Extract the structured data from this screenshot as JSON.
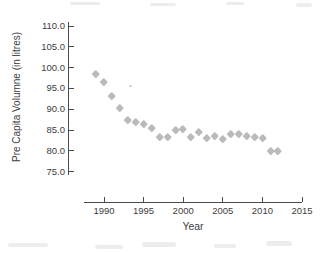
{
  "chart_data": {
    "type": "scatter",
    "title": "",
    "xlabel": "Year",
    "ylabel": "Pre Capita Volumne (in litres)",
    "x_tick_labels": [
      "1990",
      "1995",
      "2000",
      "2005",
      "2010",
      "2015"
    ],
    "x_tick_values": [
      1990,
      1995,
      2000,
      2005,
      2010,
      2015
    ],
    "y_tick_labels": [
      "110.0",
      "105.0",
      "100.0",
      "95.0",
      "90.0",
      "85.0",
      "80.0",
      "75.0"
    ],
    "y_tick_values": [
      110,
      105,
      100,
      95,
      90,
      85,
      80,
      75
    ],
    "xlim": [
      1987.4,
      2015.2
    ],
    "ylim": [
      73.3,
      111.4
    ],
    "grid": false,
    "legend": "none",
    "marker": "diamond",
    "marker_color": "#b3b3b3",
    "axis_color": "#4a4a4a",
    "text_color": "#3d3d3d",
    "x": [
      1989,
      1990,
      1991,
      1992,
      1993,
      1994,
      1995,
      1996,
      1997,
      1998,
      1999,
      2000,
      2001,
      2002,
      2003,
      2004,
      2005,
      2006,
      2007,
      2008,
      2009,
      2010,
      2011,
      2012
    ],
    "y": [
      98.6,
      96.5,
      93.3,
      90.3,
      87.4,
      86.9,
      86.4,
      85.5,
      83.3,
      83.4,
      85.1,
      85.3,
      83.4,
      84.6,
      83.2,
      83.7,
      82.8,
      84.1,
      84.2,
      83.7,
      83.4,
      83.2,
      80.0,
      80.0
    ]
  }
}
